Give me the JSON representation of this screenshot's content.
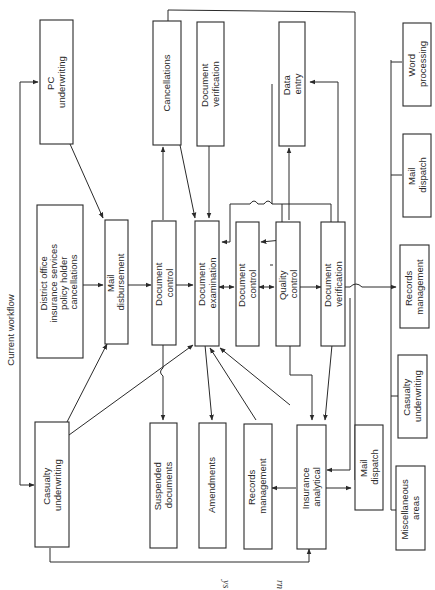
{
  "diagram": {
    "title": "Current workflow",
    "caption_fragments": [
      "ys",
      "rn"
    ],
    "colors": {
      "stroke": "#2a2a2a",
      "background": "#ffffff"
    },
    "boxes": {
      "pc_underwriting": [
        "PC",
        "underwriting"
      ],
      "district_office": [
        "District office",
        "insurance services",
        "policy holder",
        "cancellations"
      ],
      "casualty_underwriting_left": [
        "Casualty",
        "underwriting"
      ],
      "mail_disbursement": [
        "Mail",
        "disbursement"
      ],
      "cancellations": [
        "Cancellations"
      ],
      "document_verification_top": [
        "Document",
        "verification"
      ],
      "document_control_1": [
        "Document",
        "control"
      ],
      "document_examination": [
        "Document",
        "examination"
      ],
      "document_control_2": [
        "Document",
        "control"
      ],
      "data_entry": [
        "Data",
        "entry"
      ],
      "quality_control": [
        "Quality",
        "control"
      ],
      "document_verification_mid": [
        "Document",
        "verification"
      ],
      "suspended_documents": [
        "Suspended",
        "documents"
      ],
      "amendments": [
        "Amendments"
      ],
      "records_management_left": [
        "Records",
        "management"
      ],
      "insurance_analytical": [
        "Insurance",
        "analytical"
      ],
      "mail_dispatch_left": [
        "Mail",
        "dispatch"
      ],
      "word_processing": [
        "Word",
        "processing"
      ],
      "mail_dispatch_right": [
        "Mail",
        "dispatch"
      ],
      "records_management_right": [
        "Records",
        "management"
      ],
      "casualty_underwriting_right": [
        "Casualty",
        "underwriting"
      ],
      "miscellaneous_areas": [
        "Miscellaneous",
        "areas"
      ]
    }
  }
}
